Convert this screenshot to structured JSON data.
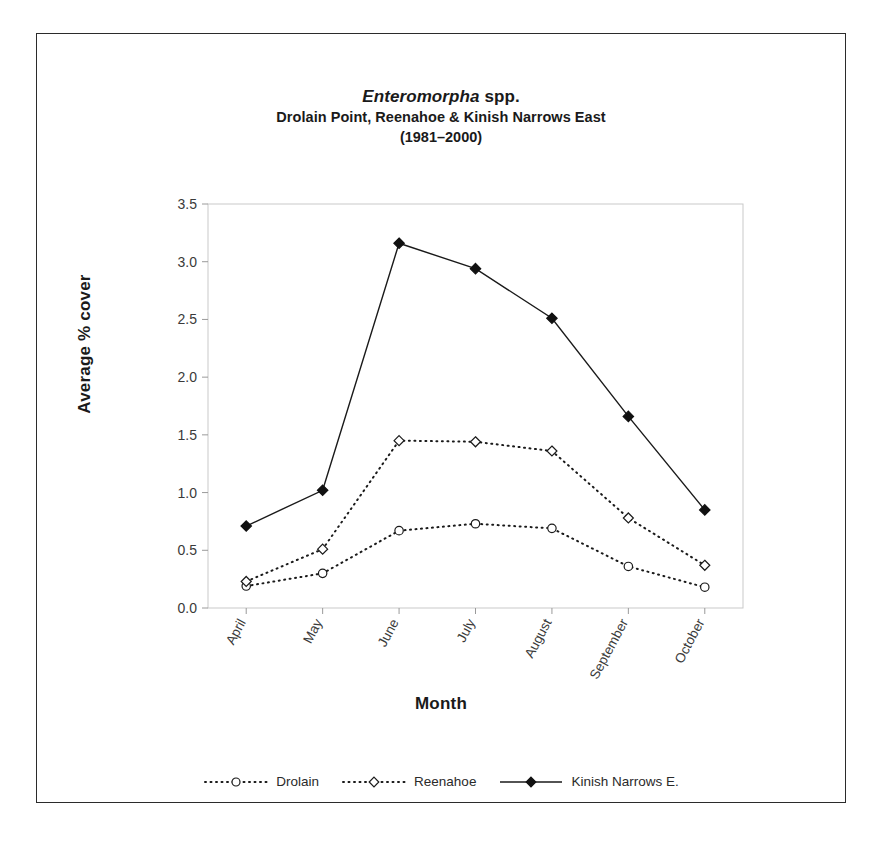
{
  "figure": {
    "title_genus": "Enteromorpha",
    "title_rest": " spp.",
    "subtitle": "Drolain Point, Reenahoe & Kinish Narrows East",
    "years": "(1981–2000)"
  },
  "chart_data": {
    "type": "line",
    "title": "Enteromorpha spp. Drolain Point, Reenahoe & Kinish Narrows East (1981–2000)",
    "xlabel": "Month",
    "ylabel": "Average % cover",
    "categories": [
      "April",
      "May",
      "June",
      "July",
      "August",
      "September",
      "October"
    ],
    "ylim": [
      0.0,
      3.5
    ],
    "yticks": [
      "0.0",
      "0.5",
      "1.0",
      "1.5",
      "2.0",
      "2.5",
      "3.0",
      "3.5"
    ],
    "ytick_values": [
      0.0,
      0.5,
      1.0,
      1.5,
      2.0,
      2.5,
      3.0,
      3.5
    ],
    "grid": false,
    "legend_position": "bottom",
    "series": [
      {
        "name": "Drolain",
        "marker": "open-circle",
        "line": "dotted",
        "color": "#1a1a1a",
        "values": [
          0.19,
          0.3,
          0.67,
          0.73,
          0.69,
          0.36,
          0.18
        ]
      },
      {
        "name": "Reenahoe",
        "marker": "open-diamond",
        "line": "dotted",
        "color": "#1a1a1a",
        "values": [
          0.23,
          0.51,
          1.45,
          1.44,
          1.36,
          0.78,
          0.37
        ]
      },
      {
        "name": "Kinish Narrows E.",
        "marker": "filled-diamond",
        "line": "solid",
        "color": "#111111",
        "values": [
          0.71,
          1.02,
          3.16,
          2.94,
          2.51,
          1.66,
          0.85
        ]
      }
    ]
  }
}
